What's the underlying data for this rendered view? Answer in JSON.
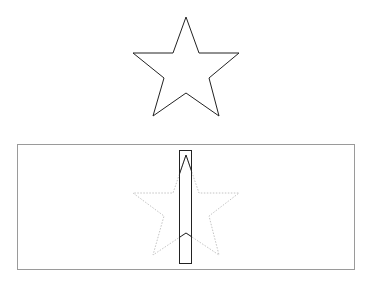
{
  "diagram": {
    "colors": {
      "background": "#ffffff",
      "star_stroke": "#222222",
      "frame_stroke": "#9a9a9a",
      "ghost_star_stroke": "#c4c4c4",
      "clip_rect_stroke": "#222222"
    },
    "top_star": {
      "points": "186,17 199,53 239,53 209,78 219,116 186,93 153,116 164,78 133,53 173,53"
    },
    "bottom_panel": {
      "frame": {
        "x": 17,
        "y": 144,
        "width": 337,
        "height": 125
      },
      "ghost_star_points": "186,155 199,193 239,193 209,216 219,255 186,233 153,255 164,216 133,193 173,193",
      "clip_rect": {
        "x": 179,
        "y": 150,
        "width": 13,
        "height": 113
      }
    }
  }
}
